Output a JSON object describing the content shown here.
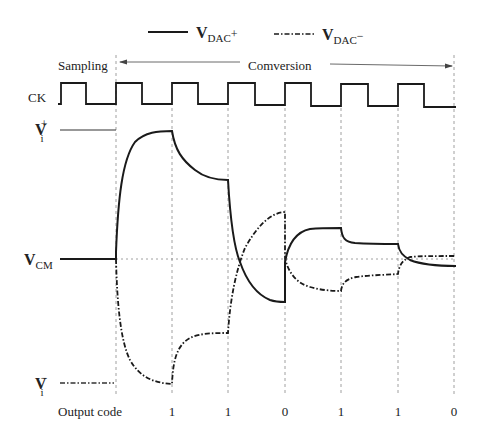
{
  "legend": {
    "pos_label": "V",
    "pos_sub": "DAC",
    "pos_sup": "+",
    "neg_label": "V",
    "neg_sub": "DAC",
    "neg_sup": "−"
  },
  "phases": {
    "sampling": "Sampling",
    "conversion": "Comversion"
  },
  "signals": {
    "clock": "CK",
    "vip_main": "V",
    "vip_sub": "i",
    "vip_sup": "+",
    "vcm_main": "V",
    "vcm_sub": "CM",
    "vin_main": "V",
    "vin_sub": "i",
    "vin_sup": "−"
  },
  "output": {
    "label": "Output code",
    "codes": [
      "1",
      "1",
      "0",
      "1",
      "1",
      "0"
    ]
  },
  "colors": {
    "line": "#1a1a1a",
    "grid": "#888888"
  }
}
